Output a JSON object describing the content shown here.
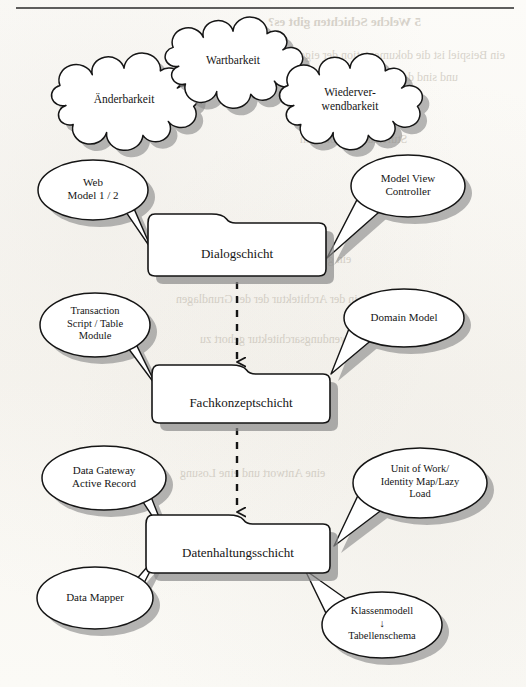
{
  "page": {
    "type": "scanned-book-page-diagram",
    "header_rule": true,
    "background_color": "#fbfaf7",
    "ink_color": "#151515",
    "shadow_color": "#8a8a8a"
  },
  "bleed_through_text": [
    "5   Welche Schichten gibt es?",
    "ein Beispiel ist die dokumentation der eigenen Frage",
    "und sind der vierten Stelle",
    "Stufe zu funktionieren",
    "ein gestell jedoch nicht so dass es",
    "in der Architektur der der Grundlagen",
    "Anwendungsarchitektur gehort zu",
    "eine Antwort und eine Losung",
    "Klassen sind die einzelnen"
  ],
  "diagram": {
    "title_clouds": [
      {
        "id": "cloud-aenderbarkeit",
        "label": "Änderbarkeit",
        "cx": 124,
        "cy": 101,
        "rx": 62,
        "ry": 33,
        "font_size": 11.5
      },
      {
        "id": "cloud-wartbarkeit",
        "label": "Wartbarkeit",
        "cx": 233,
        "cy": 62,
        "rx": 58,
        "ry": 31,
        "font_size": 11.5
      },
      {
        "id": "cloud-wiederverwend",
        "label": "Wiederver-\nwendbarkeit",
        "cx": 350,
        "cy": 101,
        "rx": 60,
        "ry": 33,
        "font_size": 11.5
      }
    ],
    "layers": [
      {
        "id": "layer-dialogschicht",
        "label": "Dialogschicht",
        "x": 148,
        "y": 214,
        "w": 178,
        "h": 62,
        "tab": "left"
      },
      {
        "id": "layer-fachkonzeptschicht",
        "label": "Fachkonzeptschicht",
        "x": 152,
        "y": 365,
        "w": 178,
        "h": 58,
        "tab": "center"
      },
      {
        "id": "layer-datenhaltungsschicht",
        "label": "Datenhaltungsschicht",
        "x": 146,
        "y": 515,
        "w": 184,
        "h": 58,
        "tab": "center"
      }
    ],
    "connectors": [
      {
        "id": "connector-dialog-to-fachkonzept",
        "style": "dashed",
        "arrow": "open-v",
        "x": 237,
        "y1": 282,
        "y2": 362
      },
      {
        "id": "connector-fachkonzept-to-daten",
        "style": "dashed",
        "arrow": "open-v",
        "x": 237,
        "y1": 428,
        "y2": 512
      }
    ],
    "callouts": [
      {
        "id": "callout-web-model",
        "label": "Web\nModel 1 / 2",
        "cx": 93,
        "cy": 190,
        "rx": 55,
        "ry": 30,
        "side": "left",
        "tail": "thin",
        "tip_x": 152,
        "tip_y": 250,
        "font_size": 11
      },
      {
        "id": "callout-mvc",
        "label": "Model View\nController",
        "cx": 408,
        "cy": 186,
        "rx": 57,
        "ry": 31,
        "side": "right",
        "tail": "wedge",
        "tip_x": 327,
        "tip_y": 258,
        "font_size": 11
      },
      {
        "id": "callout-transaction",
        "label": "Transaction\nScript / Table\nModule",
        "cx": 95,
        "cy": 325,
        "rx": 55,
        "ry": 32,
        "side": "left",
        "tail": "thin",
        "tip_x": 157,
        "tip_y": 387,
        "font_size": 10.5
      },
      {
        "id": "callout-domain-model",
        "label": "Domain Model",
        "cx": 404,
        "cy": 318,
        "rx": 60,
        "ry": 29,
        "side": "right",
        "tail": "wedge",
        "tip_x": 331,
        "tip_y": 374,
        "font_size": 11
      },
      {
        "id": "callout-data-gateway",
        "label": "Data Gateway\nActive Record",
        "cx": 104,
        "cy": 478,
        "rx": 62,
        "ry": 32,
        "side": "left",
        "tail": "thin",
        "tip_x": 168,
        "tip_y": 540,
        "font_size": 11
      },
      {
        "id": "callout-unit-of-work",
        "label": "Unit of Work/\nIdentity Map/Lazy\nLoad",
        "cx": 420,
        "cy": 483,
        "rx": 67,
        "ry": 35,
        "side": "right",
        "tail": "wedge",
        "tip_x": 334,
        "tip_y": 546,
        "font_size": 10.5
      },
      {
        "id": "callout-data-mapper",
        "label": "Data Mapper",
        "cx": 95,
        "cy": 598,
        "rx": 58,
        "ry": 31,
        "side": "left",
        "tail": "thin",
        "tip_x": 160,
        "tip_y": 552,
        "font_size": 11
      },
      {
        "id": "callout-klassenmodell",
        "label": "Klassenmodell\n↓\nTabellenschema",
        "cx": 382,
        "cy": 625,
        "rx": 60,
        "ry": 33,
        "side": "right-up",
        "tail": "wedge",
        "tip_x": 305,
        "tip_y": 570,
        "font_size": 10.5
      }
    ]
  }
}
